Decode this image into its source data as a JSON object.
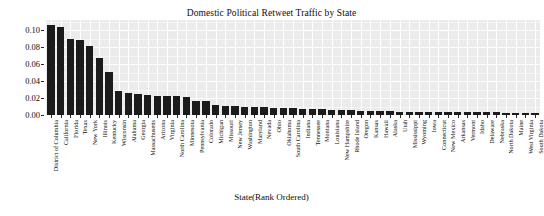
{
  "chart_data": {
    "type": "bar",
    "title": "Domestic Political Retweet Traffic by State",
    "xlabel": "State(Rank Ordered)",
    "ylabel": "Proportion of  Total Traffic",
    "ylim": [
      0,
      0.112
    ],
    "ytick_labels": [
      "0.00",
      "0.02",
      "0.04",
      "0.06",
      "0.08",
      "0.10"
    ],
    "ytick_values": [
      0.0,
      0.02,
      0.04,
      0.06,
      0.08,
      0.1
    ],
    "grid": true,
    "grid_color": "#ffffff",
    "panel_color": "#ebebeb",
    "bar_color": "#1b1b1b",
    "legend": null,
    "categories": [
      "District of Columbia",
      "California",
      "Florida",
      "Texas",
      "New York",
      "Illinois",
      "Kentucky",
      "Wisconsin",
      "Alabama",
      "Georgia",
      "Massachusetts",
      "Arizona",
      "Virginia",
      "North Carolina",
      "Minnesota",
      "Pennsylvania",
      "Colorado",
      "Michigan",
      "Missouri",
      "New Jersey",
      "Washington",
      "Maryland",
      "Nevada",
      "Ohio",
      "Oklahoma",
      "South Carolina",
      "Indiana",
      "Tennessee",
      "Montana",
      "Louisiana",
      "New Hampshire",
      "Rhode Island",
      "Oregon",
      "Kansas",
      "Hawaii",
      "Alaska",
      "Utah",
      "Mississippi",
      "Wyoming",
      "Iowa",
      "Connecticut",
      "New Mexico",
      "Arkansas",
      "Vermont",
      "Idaho",
      "Delaware",
      "Nebraska",
      "North Dakota",
      "Maine",
      "West Virginia",
      "South Dakota"
    ],
    "values": [
      0.106,
      0.104,
      0.09,
      0.089,
      0.081,
      0.067,
      0.051,
      0.028,
      0.026,
      0.025,
      0.024,
      0.023,
      0.023,
      0.022,
      0.021,
      0.016,
      0.016,
      0.012,
      0.011,
      0.011,
      0.01,
      0.009,
      0.009,
      0.008,
      0.008,
      0.008,
      0.007,
      0.007,
      0.007,
      0.006,
      0.006,
      0.006,
      0.005,
      0.005,
      0.005,
      0.005,
      0.004,
      0.004,
      0.004,
      0.004,
      0.004,
      0.003,
      0.003,
      0.003,
      0.003,
      0.003,
      0.003,
      0.002,
      0.002,
      0.002,
      0.002
    ]
  }
}
